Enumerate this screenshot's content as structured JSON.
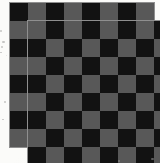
{
  "image": {
    "title": "Two overlapping checkerboards",
    "subject": "checkerboard-pattern",
    "width_px": 160,
    "height_px": 163,
    "background_color": "#fbfbf9"
  },
  "palette": {
    "dark_square": "#121212",
    "light_square": "#585858",
    "board_border": "#8f8f8f",
    "paper": "#fbfbf9",
    "speck": "#9a9a9a"
  },
  "boards": [
    {
      "name": "back-board",
      "label": "Checkerboard (upper-left)",
      "rows": 8,
      "cols": 8,
      "cell_size_px": 18,
      "left_px": 9,
      "top_px": 2,
      "start_color": "dark",
      "z": 1
    },
    {
      "name": "front-board",
      "label": "Checkerboard (lower-right)",
      "rows": 8,
      "cols": 8,
      "cell_size_px": 18,
      "left_px": 27,
      "top_px": 20,
      "start_color": "light",
      "z": 2
    }
  ],
  "specks": [
    {
      "x": 0,
      "y": 30,
      "w": 2,
      "h": 2
    },
    {
      "x": 2,
      "y": 41,
      "w": 3,
      "h": 2
    },
    {
      "x": 1,
      "y": 46,
      "w": 2,
      "h": 2
    },
    {
      "x": 0,
      "y": 52,
      "w": 2,
      "h": 1
    },
    {
      "x": 4,
      "y": 101,
      "w": 2,
      "h": 2
    },
    {
      "x": 2,
      "y": 119,
      "w": 2,
      "h": 1
    },
    {
      "x": 151,
      "y": 158,
      "w": 3,
      "h": 2
    },
    {
      "x": 118,
      "y": 160,
      "w": 2,
      "h": 2
    }
  ]
}
